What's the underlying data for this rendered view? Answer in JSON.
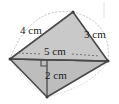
{
  "figure": {
    "shape_type": "quadrilateral-with-diagonal",
    "canvas": {
      "width": 119,
      "height": 104,
      "background": "#ffffff"
    },
    "colors": {
      "fill_upper": "#c9c9c9",
      "fill_lower": "#bdbdbd",
      "stroke": "#4a4a4a",
      "dotted_guide": "#b0b0b0",
      "dimension_line": "#555555",
      "text": "#1a1a1a"
    },
    "vertices": {
      "left": {
        "x": 10,
        "y": 59
      },
      "top": {
        "x": 73,
        "y": 12
      },
      "right": {
        "x": 108,
        "y": 61
      },
      "bottom": {
        "x": 47,
        "y": 97
      },
      "foot": {
        "x": 47,
        "y": 60
      }
    },
    "labels": [
      {
        "id": "side-upper-left",
        "text": "4 cm",
        "x": 20,
        "y": 34
      },
      {
        "id": "side-upper-right",
        "text": "3 cm",
        "x": 84,
        "y": 38
      },
      {
        "id": "diagonal-base",
        "text": "5 cm",
        "x": 44,
        "y": 55
      },
      {
        "id": "height",
        "text": "2 cm",
        "x": 45,
        "y": 79
      }
    ],
    "markers": {
      "right_angle": {
        "present": true,
        "x": 47,
        "y": 60,
        "size": 6
      }
    },
    "guides": {
      "dotted_arcs": 2,
      "dotted_dimension_lines": 2
    }
  }
}
